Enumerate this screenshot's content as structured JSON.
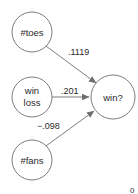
{
  "diagram": {
    "type": "network",
    "nodes": [
      {
        "id": "toes",
        "label": "#toes",
        "lines": [
          "#toes"
        ]
      },
      {
        "id": "winloss",
        "label": "win loss",
        "lines": [
          "win",
          "loss"
        ]
      },
      {
        "id": "fans",
        "label": "#fans",
        "lines": [
          "#fans"
        ]
      },
      {
        "id": "win",
        "label": "win?",
        "lines": [
          "win?"
        ]
      }
    ],
    "edges": [
      {
        "from": "toes",
        "to": "win",
        "weight": ".1119"
      },
      {
        "from": "winloss",
        "to": "win",
        "weight": ".201"
      },
      {
        "from": "fans",
        "to": "win",
        "weight": "−.098"
      }
    ],
    "corner_label": "0",
    "colors": {
      "stroke": "#6e6e6e",
      "arrow": "#6e6e6e",
      "text": "#2a2a2a",
      "background": "#ffffff"
    }
  }
}
